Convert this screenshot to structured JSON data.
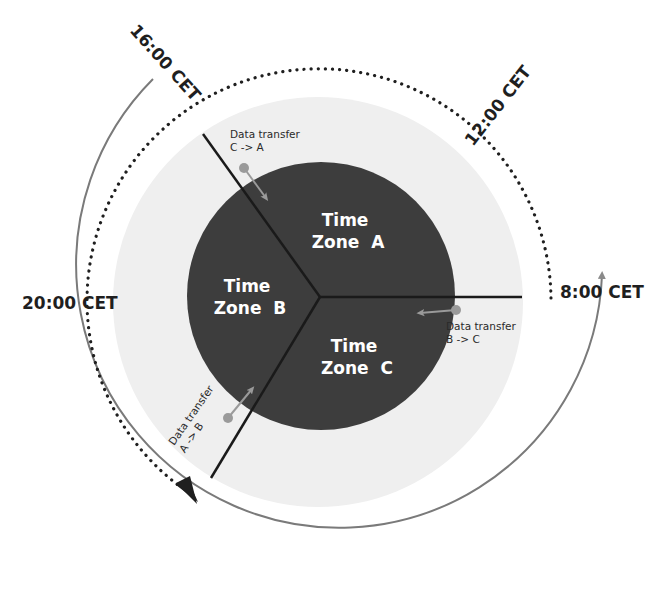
{
  "diagram": {
    "zones": [
      {
        "line1": "Time",
        "line2": "Zone  A"
      },
      {
        "line1": "Time",
        "line2": "Zone  B"
      },
      {
        "line1": "Time",
        "line2": "Zone  C"
      }
    ],
    "transfers": [
      {
        "line1": "Data transfer",
        "line2": "C -> A"
      },
      {
        "line1": "Data transfer",
        "line2": "B -> C"
      },
      {
        "line1": "Data transfer",
        "line2": "A -> B"
      }
    ],
    "times": {
      "t8": "8:00 CET",
      "t12": "12:00 CET",
      "t16": "16:00 CET",
      "t20": "20:00 CET"
    },
    "colors": {
      "inner_circle": "#3d3d3d",
      "outer_disc": "#efefef",
      "divider": "#1a1a1a",
      "transfer_arrow": "#9a9a9a",
      "outer_arc": "#7a7a7a",
      "dotted_arc": "#1f1f1f"
    }
  }
}
